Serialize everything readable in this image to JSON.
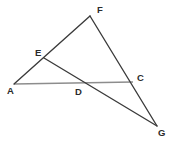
{
  "figure": {
    "type": "geometry-diagram",
    "width": 174,
    "height": 143,
    "background_color": "#ffffff",
    "stroke_color_dark": "#3a3a3a",
    "stroke_color_gray": "#8d8d8d",
    "label_color": "#2b2b2b",
    "points": [
      {
        "id": "F",
        "label": "F",
        "x": 90,
        "y": 16,
        "label_x": 97,
        "label_y": 5
      },
      {
        "id": "E",
        "label": "E",
        "x": 44,
        "y": 58,
        "label_x": 35,
        "label_y": 48
      },
      {
        "id": "A",
        "label": "A",
        "x": 14,
        "y": 84,
        "label_x": 7,
        "label_y": 86
      },
      {
        "id": "D",
        "label": "D",
        "x": 78,
        "y": 83,
        "label_x": 75,
        "label_y": 87
      },
      {
        "id": "C",
        "label": "C",
        "x": 133,
        "y": 82,
        "label_x": 137,
        "label_y": 73
      },
      {
        "id": "G",
        "label": "G",
        "x": 157,
        "y": 126,
        "label_x": 158,
        "label_y": 128
      }
    ],
    "segments": [
      {
        "id": "AF",
        "from": "A",
        "to": "F",
        "through": "E",
        "style": "dark",
        "path": "M 14 84 L 90 16"
      },
      {
        "id": "FG",
        "from": "F",
        "to": "G",
        "through": "C",
        "style": "dark",
        "path": "M 90 16 L 157 126"
      },
      {
        "id": "AC",
        "from": "A",
        "to": "C",
        "through": "D",
        "style": "gray",
        "path": "M 14 84 L 133 82"
      },
      {
        "id": "EG",
        "from": "E",
        "to": "G",
        "through": "D",
        "style": "dark",
        "path": "M 44 58 L 157 126"
      }
    ]
  }
}
